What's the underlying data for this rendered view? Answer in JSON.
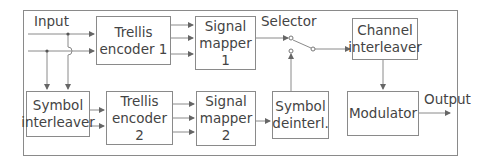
{
  "diagram": {
    "labels": {
      "input": "Input",
      "selector": "Selector",
      "output": "Output"
    },
    "blocks": {
      "trellis_encoder_1": {
        "line1": "Trellis",
        "line2": "encoder 1"
      },
      "signal_mapper_1": {
        "line1": "Signal",
        "line2": "mapper 1"
      },
      "symbol_interleaver": {
        "line1": "Symbol",
        "line2": "interleaver"
      },
      "trellis_encoder_2": {
        "line1": "Trellis",
        "line2": "encoder 2"
      },
      "signal_mapper_2": {
        "line1": "Signal",
        "line2": "mapper 2"
      },
      "symbol_deinterleaver": {
        "line1": "Symbol",
        "line2": "deinterl."
      },
      "channel_interleaver": {
        "line1": "Channel",
        "line2": "interleaver"
      },
      "modulator": {
        "line1": "Modulator"
      }
    },
    "colors": {
      "stroke": "#8a8a8a",
      "text": "#444444",
      "background": "#ffffff"
    }
  }
}
